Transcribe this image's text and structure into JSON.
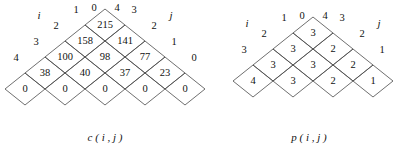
{
  "figures": [
    {
      "id": "c",
      "caption": "c ( i , j )",
      "axis_left_label": "i",
      "axis_right_label": "j",
      "apex_left_label": "0",
      "apex_right_label": "4",
      "left_edge_labels": [
        "1",
        "2",
        "3",
        "4"
      ],
      "right_edge_labels": [
        "3",
        "2",
        "1",
        "0"
      ],
      "rows": [
        [
          "215"
        ],
        [
          "158",
          "141"
        ],
        [
          "100",
          "98",
          "77"
        ],
        [
          "38",
          "40",
          "37",
          "23"
        ],
        [
          "0",
          "0",
          "0",
          "0",
          "0"
        ]
      ],
      "geometry": {
        "apex_x": 105,
        "apex_y": 9,
        "half_w": 20,
        "half_h": 16,
        "rows": 5
      }
    },
    {
      "id": "p",
      "caption": "p ( i , j )",
      "axis_left_label": "i",
      "axis_right_label": "j",
      "apex_left_label": "0",
      "apex_right_label": "4",
      "left_edge_labels": [
        "1",
        "2",
        "3"
      ],
      "right_edge_labels": [
        "3",
        "2",
        "1"
      ],
      "rows": [
        [
          "3"
        ],
        [
          "3",
          "2"
        ],
        [
          "3",
          "3",
          "2"
        ],
        [
          "4",
          "3",
          "2",
          "1"
        ]
      ],
      "geometry": {
        "apex_x": 114,
        "apex_y": 17,
        "half_w": 20,
        "half_h": 16,
        "rows": 4
      }
    }
  ],
  "style": {
    "line_color": "#4a4a4a",
    "text_color": "#111111",
    "background": "#ffffff"
  }
}
